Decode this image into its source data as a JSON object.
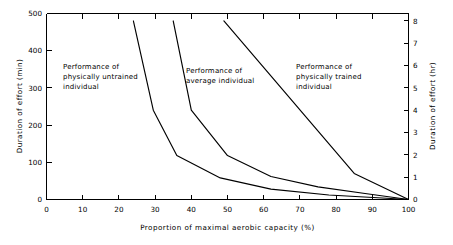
{
  "chart_data": {
    "type": "line",
    "title": "",
    "xlabel": "Proportion of maximal aerobic capacity (%)",
    "ylabel": "Duration of effort (min)",
    "y2label": "Duration of effort (hr)",
    "xlim": [
      0,
      100
    ],
    "ylim": [
      0,
      500
    ],
    "y2lim": [
      0,
      8.3333
    ],
    "grid": false,
    "legend_position": "inline-annotations",
    "xticks": [
      0,
      10,
      20,
      30,
      40,
      50,
      60,
      70,
      80,
      90,
      100
    ],
    "xticklabels": [
      "0",
      "10",
      "20",
      "30",
      "40",
      "50",
      "60",
      "70",
      "80",
      "90",
      "100"
    ],
    "yticks": [
      0,
      100,
      200,
      300,
      400,
      500
    ],
    "yticklabels": [
      "0",
      "100",
      "200",
      "300",
      "400",
      "500"
    ],
    "y2ticks": [
      0,
      1,
      2,
      3,
      4,
      5,
      6,
      7,
      8
    ],
    "y2ticklabels": [
      "0",
      "1",
      "2",
      "3",
      "4",
      "5",
      "6",
      "7",
      "8"
    ],
    "series": [
      {
        "name": "Performance of physically untrained individual",
        "x": [
          24,
          29.5,
          36,
          48,
          62,
          78,
          100
        ],
        "y": [
          480,
          240,
          118,
          58,
          28,
          12,
          0
        ]
      },
      {
        "name": "Performance of average individual",
        "x": [
          35,
          40,
          50,
          62,
          75,
          88,
          100
        ],
        "y": [
          480,
          240,
          118,
          62,
          34,
          16,
          0
        ]
      },
      {
        "name": "Performance of physically trained individual",
        "x": [
          49,
          85,
          100
        ],
        "y": [
          480,
          70,
          0
        ]
      }
    ],
    "annotations": [
      {
        "id": "untrained",
        "lines": [
          "Performance of",
          "physically untrained",
          "individual"
        ],
        "x_px": 63,
        "y_px": 69
      },
      {
        "id": "average",
        "lines": [
          "Performance of",
          "average individual"
        ],
        "x_px": 186,
        "y_px": 73
      },
      {
        "id": "trained",
        "lines": [
          "Performance of",
          "physically trained",
          "individual"
        ],
        "x_px": 296,
        "y_px": 69
      }
    ]
  },
  "figure": {
    "line_color": "#000000",
    "background": "#ffffff"
  }
}
